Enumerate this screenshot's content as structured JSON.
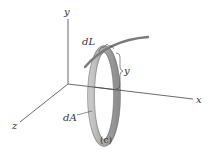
{
  "figure": {
    "caption": "(c)",
    "labels": {
      "y_axis": "y",
      "x_axis": "x",
      "z_axis": "z",
      "dL": "dL",
      "y_distance": "y",
      "dA": "dA"
    },
    "colors": {
      "axis": "#333333",
      "curve": "#7a7a7a",
      "ring_fill": "#b9b9b9",
      "ring_edge": "#555555"
    }
  }
}
